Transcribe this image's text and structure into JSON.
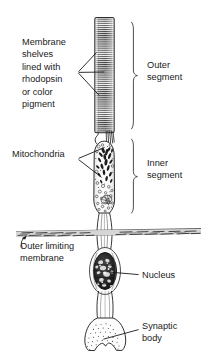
{
  "figure": {
    "background_color": "#ffffff",
    "ink_color": "#1a1a1a"
  },
  "labels": {
    "membrane_shelves": {
      "name": "membrane-shelves-label",
      "lines": [
        "Membrane",
        "shelves",
        "lined with",
        "rhodopsin",
        "or color",
        "pigment"
      ],
      "x": 22,
      "y_start": 45,
      "line_height": 12.4
    },
    "mitochondria": {
      "name": "mitochondria-label",
      "lines": [
        "Mitochondria"
      ],
      "x": 12,
      "y_start": 157
    },
    "outer_limiting_membrane": {
      "name": "outer-limiting-membrane-label",
      "lines": [
        "Outer limiting",
        "membrane"
      ],
      "x": 20,
      "y_start": 249,
      "line_height": 12.4
    },
    "outer_segment": {
      "name": "outer-segment-label",
      "lines": [
        "Outer",
        "segment"
      ],
      "x": 147,
      "y_start": 68,
      "line_height": 12.4
    },
    "inner_segment": {
      "name": "inner-segment-label",
      "lines": [
        "Inner",
        "segment"
      ],
      "x": 147,
      "y_start": 166,
      "line_height": 12.4
    },
    "nucleus": {
      "name": "nucleus-label",
      "lines": [
        "Nucleus"
      ],
      "x": 142,
      "y_start": 278
    },
    "synaptic_body": {
      "name": "synaptic-body-label",
      "lines": [
        "Synaptic",
        "body"
      ],
      "x": 142,
      "y_start": 329,
      "line_height": 12.4
    }
  },
  "structures": {
    "outer_segment": {
      "name": "outer-segment-cylinder",
      "description": "striated cylinder of membrane discs",
      "x": 95,
      "y": 17,
      "width": 19,
      "height": 116,
      "stripe_count": 56,
      "fill": "#f2f2f2",
      "stripe_color": "#3b3b3b"
    },
    "connecting_cilium": {
      "name": "connecting-cilium",
      "y": 133,
      "height": 9
    },
    "inner_segment": {
      "name": "inner-segment-body",
      "description": "granular capsule containing mitochondria",
      "x": 93,
      "y": 141,
      "width": 22,
      "height": 72,
      "fill": "#fbfbfb"
    },
    "outer_limiting_membrane": {
      "name": "outer-limiting-membrane-band",
      "x": 16,
      "y": 231,
      "width": 186,
      "height": 7,
      "fill": "#9a9a9a"
    },
    "nucleus": {
      "name": "nucleus-oval",
      "cx": 105,
      "cy": 271,
      "rx": 12,
      "ry": 19,
      "fill": "#2a2a2a"
    },
    "synaptic_body": {
      "name": "synaptic-body-shape",
      "x": 84,
      "y": 318,
      "width": 42,
      "height": 34,
      "fill": "#fcfcfc"
    }
  },
  "braces": {
    "outer_segment_brace": {
      "name": "outer-segment-brace",
      "x": 131,
      "y_top": 22,
      "y_bottom": 129,
      "tip_x": 138
    },
    "inner_segment_brace": {
      "name": "inner-segment-brace",
      "x": 131,
      "y_top": 139,
      "y_bottom": 213,
      "tip_x": 138
    }
  },
  "leaders": {
    "membrane_shelves": {
      "name": "membrane-shelves-leader",
      "origin_x": 78,
      "origin_y": 72,
      "targets": [
        [
          96,
          52
        ],
        [
          104,
          72
        ],
        [
          99,
          95
        ]
      ]
    },
    "mitochondria": {
      "name": "mitochondria-leader",
      "origin_x": 78,
      "origin_y": 159,
      "targets": [
        [
          104,
          147
        ],
        [
          101,
          177
        ]
      ]
    },
    "outer_limiting_membrane": {
      "name": "outer-limiting-membrane-leader",
      "origin_x": 22,
      "origin_y": 247,
      "target_x": 30,
      "target_y": 236
    },
    "nucleus": {
      "name": "nucleus-leader",
      "origin_x": 139,
      "origin_y": 275,
      "target_x": 110,
      "target_y": 272
    },
    "synaptic_body": {
      "name": "synaptic-body-leader",
      "origin_x": 139,
      "origin_y": 330,
      "target_x": 103,
      "target_y": 339
    }
  }
}
